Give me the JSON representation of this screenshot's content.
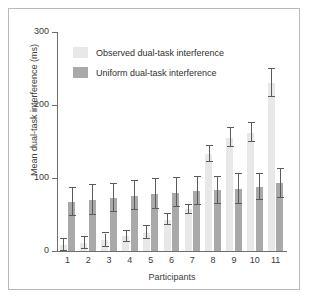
{
  "chart_data": {
    "type": "bar",
    "title": "",
    "xlabel": "Participants",
    "ylabel": "Mean dual-task interference (ms)",
    "ylim": [
      0,
      300
    ],
    "yticks": [
      0,
      100,
      200,
      300
    ],
    "ytick_labels": [
      "0",
      "100",
      "200",
      "300"
    ],
    "grid": false,
    "legend_position": "upper-left-inside",
    "categories": [
      "1",
      "2",
      "3",
      "4",
      "5",
      "6",
      "7",
      "8",
      "9",
      "10",
      "11"
    ],
    "series": [
      {
        "name": "Observed dual-task interference",
        "color": "#e8e8e8",
        "values": [
          8,
          11,
          15,
          20,
          25,
          43,
          57,
          133,
          155,
          162,
          230
        ],
        "errors": [
          8,
          8,
          9,
          8,
          9,
          8,
          6,
          11,
          13,
          13,
          19
        ]
      },
      {
        "name": "Uniform dual-task interference",
        "color": "#a9a9a9",
        "values": [
          67,
          70,
          73,
          76,
          78,
          80,
          82,
          83,
          85,
          88,
          93
        ],
        "errors": [
          19,
          20,
          19,
          20,
          21,
          20,
          19,
          19,
          21,
          18,
          20
        ]
      }
    ]
  },
  "legend": {
    "items": [
      {
        "label": "Observed dual-task interference",
        "color": "#e8e8e8"
      },
      {
        "label": "Uniform dual-task interference",
        "color": "#a9a9a9"
      }
    ]
  }
}
